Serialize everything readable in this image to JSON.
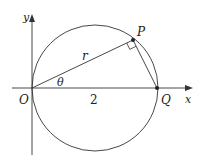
{
  "diagram": {
    "labels": {
      "y_axis": "y",
      "x_axis": "x",
      "origin": "O",
      "point_p": "P",
      "point_q": "Q",
      "radius": "r",
      "angle": "θ",
      "segment_oq": "2"
    },
    "colors": {
      "stroke": "#333333",
      "text": "#222222",
      "background": "#ffffff"
    }
  }
}
